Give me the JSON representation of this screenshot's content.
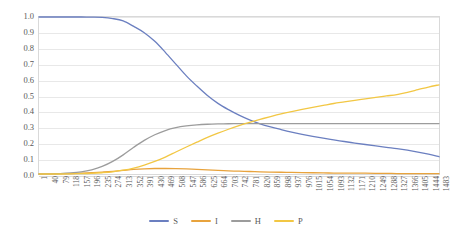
{
  "chart_data": {
    "type": "line",
    "title": "",
    "xlabel": "",
    "ylabel": "",
    "xlim": [
      1,
      1483
    ],
    "ylim": [
      0.0,
      1.0
    ],
    "grid": true,
    "legend_position": "bottom",
    "y_ticks": [
      "0.0",
      "0.1",
      "0.2",
      "0.3",
      "0.4",
      "0.5",
      "0.6",
      "0.7",
      "0.8",
      "0.9",
      "1.0"
    ],
    "x_tick_labels": [
      "1",
      "40",
      "79",
      "118",
      "157",
      "196",
      "235",
      "274",
      "313",
      "352",
      "391",
      "430",
      "469",
      "508",
      "547",
      "586",
      "625",
      "664",
      "703",
      "742",
      "781",
      "820",
      "859",
      "898",
      "937",
      "976",
      "1015",
      "1054",
      "1093",
      "1132",
      "1171",
      "1210",
      "1249",
      "1288",
      "1327",
      "1366",
      "1405",
      "1444",
      "1483"
    ],
    "x": [
      1,
      40,
      79,
      118,
      157,
      196,
      235,
      274,
      313,
      352,
      391,
      430,
      469,
      508,
      547,
      586,
      625,
      664,
      703,
      742,
      781,
      820,
      859,
      898,
      937,
      976,
      1015,
      1054,
      1093,
      1132,
      1171,
      1210,
      1249,
      1288,
      1327,
      1366,
      1405,
      1444,
      1483
    ],
    "series": [
      {
        "name": "S",
        "color": "#6b7fc0",
        "values": [
          1.0,
          1.0,
          1.0,
          1.0,
          1.0,
          0.999,
          0.997,
          0.99,
          0.975,
          0.94,
          0.9,
          0.845,
          0.775,
          0.7,
          0.625,
          0.56,
          0.5,
          0.45,
          0.41,
          0.375,
          0.345,
          0.32,
          0.3,
          0.283,
          0.267,
          0.253,
          0.24,
          0.228,
          0.217,
          0.207,
          0.197,
          0.188,
          0.179,
          0.17,
          0.162,
          0.152,
          0.14,
          0.126,
          0.11
        ]
      },
      {
        "name": "I",
        "color": "#e8a33d",
        "values": [
          0.0,
          0.001,
          0.002,
          0.003,
          0.005,
          0.008,
          0.012,
          0.017,
          0.023,
          0.029,
          0.033,
          0.035,
          0.035,
          0.034,
          0.032,
          0.029,
          0.026,
          0.023,
          0.02,
          0.018,
          0.016,
          0.014,
          0.012,
          0.011,
          0.01,
          0.009,
          0.008,
          0.007,
          0.006,
          0.006,
          0.005,
          0.005,
          0.004,
          0.004,
          0.003,
          0.003,
          0.003,
          0.002,
          0.002
        ]
      },
      {
        "name": "H",
        "color": "#9c9c9c",
        "values": [
          0.0,
          0.001,
          0.003,
          0.007,
          0.014,
          0.027,
          0.048,
          0.08,
          0.122,
          0.17,
          0.214,
          0.25,
          0.277,
          0.295,
          0.306,
          0.313,
          0.317,
          0.319,
          0.32,
          0.321,
          0.321,
          0.321,
          0.321,
          0.321,
          0.321,
          0.321,
          0.321,
          0.321,
          0.321,
          0.321,
          0.321,
          0.321,
          0.321,
          0.321,
          0.321,
          0.321,
          0.321,
          0.321,
          0.321
        ]
      },
      {
        "name": "P",
        "color": "#f2c744",
        "values": [
          0.0,
          0.0,
          0.0,
          0.001,
          0.002,
          0.004,
          0.008,
          0.014,
          0.024,
          0.038,
          0.057,
          0.08,
          0.108,
          0.14,
          0.172,
          0.203,
          0.233,
          0.26,
          0.285,
          0.308,
          0.329,
          0.348,
          0.366,
          0.383,
          0.398,
          0.412,
          0.425,
          0.437,
          0.449,
          0.459,
          0.469,
          0.479,
          0.488,
          0.497,
          0.506,
          0.52,
          0.537,
          0.554,
          0.568
        ]
      }
    ]
  },
  "legend": {
    "items": [
      {
        "label": "S",
        "color": "#6b7fc0"
      },
      {
        "label": "I",
        "color": "#e8a33d"
      },
      {
        "label": "H",
        "color": "#9c9c9c"
      },
      {
        "label": "P",
        "color": "#f2c744"
      }
    ]
  }
}
